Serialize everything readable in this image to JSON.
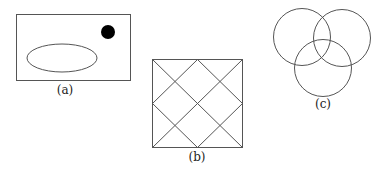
{
  "figures": {
    "a": {
      "label": "(a)",
      "shapes": [
        "rectangle",
        "filled-circle",
        "ellipse"
      ]
    },
    "b": {
      "label": "(b)",
      "shapes": [
        "square",
        "diagonal-lattice"
      ]
    },
    "c": {
      "label": "(c)",
      "shapes": [
        "three-overlapping-circles"
      ]
    }
  },
  "colors": {
    "stroke": "#555555",
    "fill_dot": "#000000",
    "background": "#ffffff"
  }
}
